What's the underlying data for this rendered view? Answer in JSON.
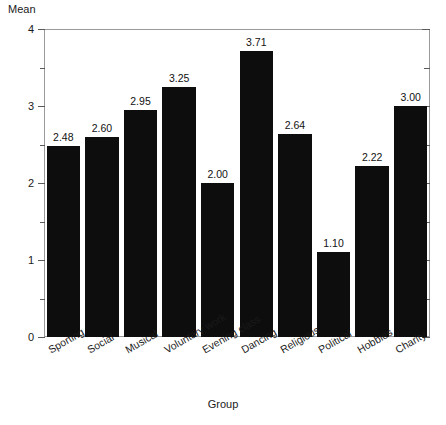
{
  "chart_data": {
    "type": "bar",
    "title": "",
    "subtitle": "",
    "xlabel": "Group",
    "ylabel": "Mean",
    "ylim": [
      0,
      4
    ],
    "xlim_categories": 10,
    "grid": false,
    "legend": "none",
    "y_major_ticks": [
      "0",
      "1",
      "2",
      "3",
      "4"
    ],
    "y_major_values": [
      0,
      1,
      2,
      3,
      4
    ],
    "y_minor_values": [
      0.5,
      1.5,
      2.5,
      3.5
    ],
    "categories": [
      "Sporting",
      "Social",
      "Musical",
      "Voluntary work",
      "Evening class",
      "Dancing",
      "Religious",
      "Political",
      "Hobbies",
      "Charity"
    ],
    "values": [
      2.48,
      2.6,
      2.95,
      3.25,
      2.0,
      3.71,
      2.64,
      1.1,
      2.22,
      3.0
    ],
    "data_labels": [
      "2.48",
      "2.60",
      "2.95",
      "3.25",
      "2.00",
      "3.71",
      "2.64",
      "1.10",
      "2.22",
      "3.00"
    ],
    "bar_color": "#0d0d0d",
    "frame_color": "#9a9a9a",
    "background_color": "#ffffff",
    "text_color": "#1a1a1a"
  }
}
